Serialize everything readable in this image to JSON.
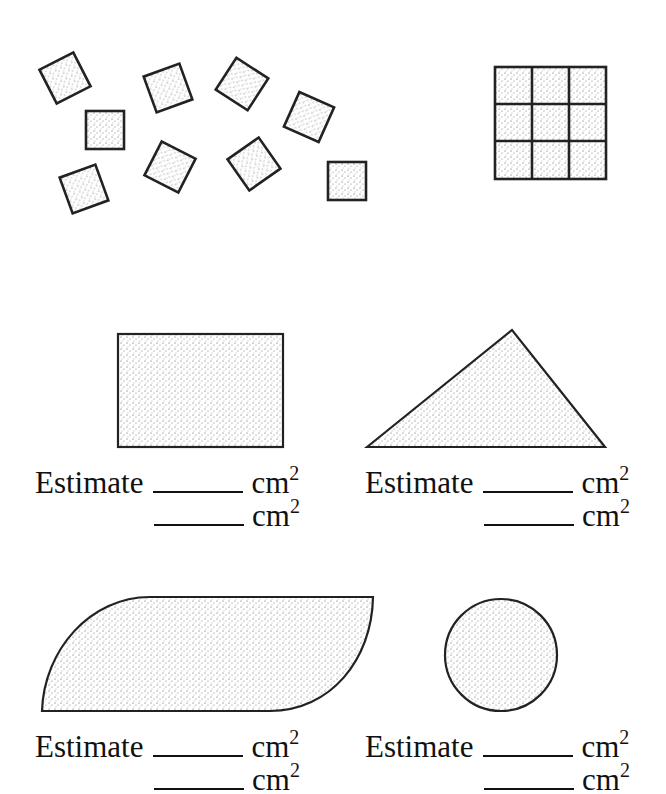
{
  "worksheet": {
    "unit_square_count": 9,
    "grid": {
      "rows": 3,
      "cols": 3
    },
    "shapes": [
      {
        "name": "rectangle",
        "estimate_label": "Estimate",
        "unit": "cm",
        "exponent": "2"
      },
      {
        "name": "triangle",
        "estimate_label": "Estimate",
        "unit": "cm",
        "exponent": "2"
      },
      {
        "name": "leaf-shape",
        "estimate_label": "Estimate",
        "unit": "cm",
        "exponent": "2"
      },
      {
        "name": "circle",
        "estimate_label": "Estimate",
        "unit": "cm",
        "exponent": "2"
      }
    ]
  }
}
